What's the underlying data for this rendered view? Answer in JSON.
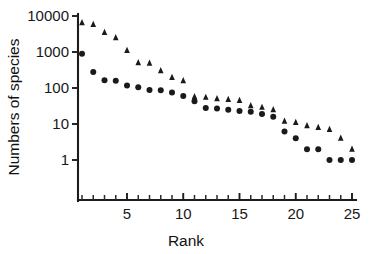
{
  "chart_data": {
    "type": "scatter",
    "title": "",
    "xlabel": "Rank",
    "ylabel": "Numbers of species",
    "x": [
      1,
      2,
      3,
      4,
      5,
      6,
      7,
      8,
      9,
      10,
      11,
      12,
      13,
      14,
      15,
      16,
      17,
      18,
      19,
      20,
      21,
      22,
      23,
      24,
      25
    ],
    "xlim": [
      0.4,
      25.6
    ],
    "ylim": [
      1,
      10000
    ],
    "yscale": "log",
    "xtick_labels": [
      "5",
      "10",
      "15",
      "20",
      "25"
    ],
    "xticks": [
      5,
      10,
      15,
      20,
      25
    ],
    "xminorticks": [
      1,
      2,
      3,
      4,
      5,
      6,
      7,
      8,
      9,
      10,
      11,
      12,
      13,
      14,
      15,
      16,
      17,
      18,
      19,
      20,
      21,
      22,
      23,
      24,
      25
    ],
    "ytick_labels": [
      "1",
      "10",
      "100",
      "1000",
      "10000"
    ],
    "yticks": [
      1,
      10,
      100,
      1000,
      10000
    ],
    "grid": false,
    "legend": "none",
    "series": [
      {
        "name": "triangles",
        "marker": "triangle",
        "color": "#1a1a1a",
        "values": [
          6500,
          5800,
          3500,
          2500,
          1100,
          500,
          490,
          300,
          195,
          160,
          57,
          55,
          50,
          48,
          45,
          32,
          29,
          25,
          12,
          11,
          9,
          8,
          7,
          4,
          2
        ]
      },
      {
        "name": "circles",
        "marker": "circle",
        "color": "#1a1a1a",
        "values": [
          900,
          280,
          165,
          160,
          118,
          105,
          88,
          87,
          75,
          60,
          43,
          28,
          27,
          25,
          23,
          22,
          19,
          16,
          6.2,
          4,
          2,
          2,
          1,
          1,
          1
        ]
      }
    ]
  },
  "axes": {
    "ylabel": "Numbers of species",
    "xlabel": "Rank"
  }
}
